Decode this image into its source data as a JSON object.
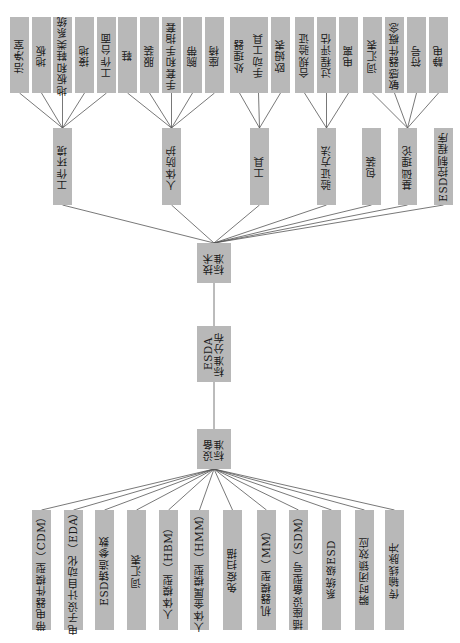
{
  "diagram": {
    "root": {
      "id": "esda",
      "label": "ESDA\n标准分布"
    },
    "branches": [
      {
        "id": "tech",
        "label": "技术\n标准"
      },
      {
        "id": "device",
        "label": "设备\n标准"
      }
    ],
    "tech_categories": [
      {
        "id": "work_env",
        "label": "工作环境",
        "children": [
          "洁净室",
          "地板",
          "地板和鞋类系统",
          "接地",
          "工作台面"
        ]
      },
      {
        "id": "body_protect",
        "label": "人体防护",
        "children": [
          "鞋",
          "服装",
          "手套和手指套",
          "腕带",
          "座椅"
        ]
      },
      {
        "id": "tools",
        "label": "工具",
        "children": [
          "处理器",
          "手动工具",
          "欧姆表"
        ]
      },
      {
        "id": "verify",
        "label": "验证方法",
        "children": [
          "合规验证",
          "过程评估",
          "电离"
        ]
      },
      {
        "id": "package",
        "label": "包装",
        "children": []
      },
      {
        "id": "basics",
        "label": "基础理论",
        "children": [
          "词汇表",
          "敏感器件概念",
          "符号",
          "静电"
        ]
      },
      {
        "id": "esd_program",
        "label": "ESD控制程序",
        "children": []
      }
    ],
    "device_items": [
      "带电器件模型（CDM）",
      "电子设计自动化（EDA）",
      "ESD铸造参数",
      "词汇表",
      "人体模型（HBM）",
      "人体金属模型（HMM）",
      "免疫扫描",
      "机器模型（MM）",
      "插座设备型号（SDM）",
      "系统级ESD",
      "瞬时闭锁效应",
      "传输线脉冲"
    ]
  },
  "colors": {
    "box": "#b8b8b8",
    "line": "#555555",
    "text": "#1a1a1a"
  }
}
